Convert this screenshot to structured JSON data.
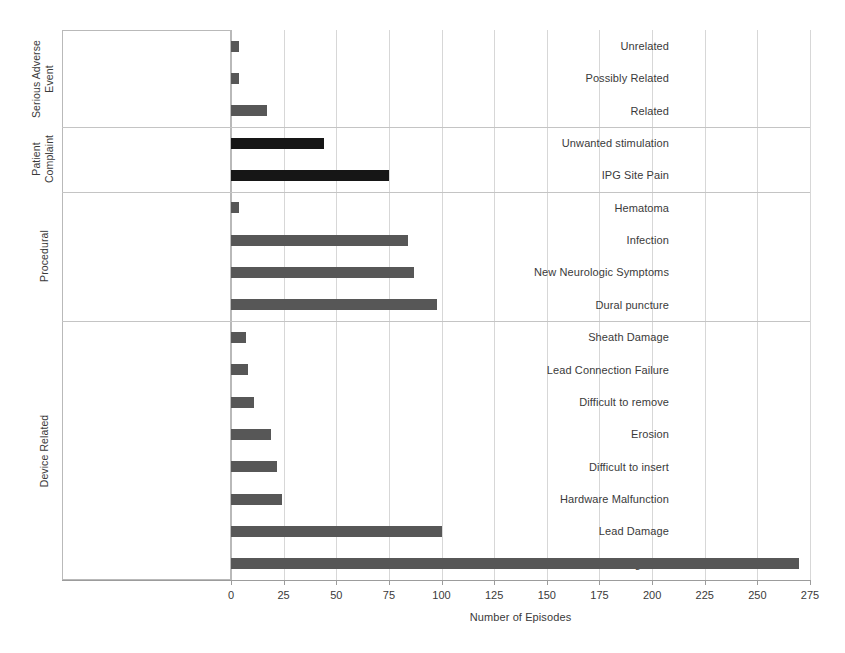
{
  "chart_data": {
    "type": "bar",
    "orientation": "horizontal",
    "title": "",
    "xlabel": "Number of Episodes",
    "ylabel": "",
    "xlim": [
      0,
      275
    ],
    "xticks": [
      0,
      25,
      50,
      75,
      100,
      125,
      150,
      175,
      200,
      225,
      250,
      275
    ],
    "grid": "vertical",
    "legend": "none",
    "categories": [
      "Unrelated",
      "Possibly Related",
      "Related",
      "Unwanted stimulation",
      "IPG Site Pain",
      "Hematoma",
      "Infection",
      "New Neurologic Symptoms",
      "Dural puncture",
      "Sheath Damage",
      "Lead Connection Failure",
      "Difficult to remove",
      "Erosion",
      "Difficult to insert",
      "Hardware Malfunction",
      "Lead Damage",
      "Migration"
    ],
    "values": [
      4,
      4,
      17,
      44,
      75,
      4,
      84,
      87,
      98,
      7,
      8,
      11,
      19,
      22,
      24,
      100,
      270
    ],
    "groups": [
      {
        "label": "Serious Adverse Event",
        "label_lines": [
          "Serious Adverse",
          "Event"
        ],
        "start": 0,
        "count": 3
      },
      {
        "label": "Patient Complaint",
        "label_lines": [
          "Patient",
          "Complaint"
        ],
        "start": 3,
        "count": 2
      },
      {
        "label": "Procedural",
        "label_lines": [
          "Procedural"
        ],
        "start": 5,
        "count": 4
      },
      {
        "label": "Device Related",
        "label_lines": [
          "Device Related"
        ],
        "start": 9,
        "count": 8
      }
    ],
    "bar_colors": {
      "default": "#575757",
      "patient_complaint": "#161616"
    }
  }
}
